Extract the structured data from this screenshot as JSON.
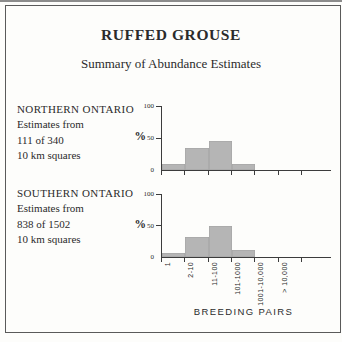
{
  "header": {
    "title": "RUFFED GROUSE",
    "subtitle": "Summary of Abundance Estimates"
  },
  "sections": [
    {
      "region": "NORTHERN ONTARIO",
      "line1": "Estimates from",
      "line2": "111 of 340",
      "line3": "10 km squares"
    },
    {
      "region": "SOUTHERN ONTARIO",
      "line1": "Estimates from",
      "line2": "838 of 1502",
      "line3": "10 km squares"
    }
  ],
  "chart_data": [
    {
      "type": "bar",
      "region": "Northern Ontario",
      "categories": [
        "1",
        "2-10",
        "11-100",
        "101-1000",
        "1001-10,000",
        "> 10,000"
      ],
      "values": [
        10,
        35,
        46,
        10,
        0,
        0
      ],
      "xlabel": "BREEDING PAIRS",
      "ylabel": "%",
      "ylim": [
        0,
        100
      ],
      "yticks": [
        0,
        50,
        100
      ],
      "grid": false,
      "x_tick_labels_shown": false
    },
    {
      "type": "bar",
      "region": "Southern Ontario",
      "categories": [
        "1",
        "2-10",
        "11-100",
        "101-1000",
        "1001-10,000",
        "> 10,000"
      ],
      "values": [
        7,
        32,
        50,
        11,
        0,
        0
      ],
      "xlabel": "BREEDING PAIRS",
      "ylabel": "%",
      "ylim": [
        0,
        100
      ],
      "yticks": [
        0,
        50,
        100
      ],
      "grid": false,
      "x_tick_labels_shown": true
    }
  ],
  "colors": {
    "bar_fill": "#b5b5b5",
    "axis": "#3c3c3c",
    "text": "#2b2b2b",
    "frame": "#5a5a5a",
    "background": "#fdfdfb"
  }
}
